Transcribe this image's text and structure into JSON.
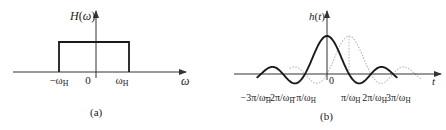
{
  "panel_a": {
    "ylabel": "H(ω)",
    "ylabel_fn": "H",
    "ylabel_arg": "ω",
    "xlabel": "ω",
    "ticks": [
      {
        "label": "−ω",
        "sub": "H",
        "x": 59
      },
      {
        "label": "0",
        "sub": "",
        "x": 88
      },
      {
        "label": "ω",
        "sub": "H",
        "x": 122
      }
    ],
    "caption": "(a)"
  },
  "panel_b": {
    "ylabel": "h(t)",
    "ylabel_fn": "h",
    "ylabel_arg": "t",
    "xlabel": "t",
    "origin_label": "0",
    "ticks": [
      {
        "label": "−3π/ω",
        "sub": "H",
        "n": -3
      },
      {
        "label": "−2π/ω",
        "sub": "H",
        "n": -2
      },
      {
        "label": "−π/ω",
        "sub": "H",
        "n": -1
      },
      {
        "label": "π/ω",
        "sub": "H",
        "n": 1
      },
      {
        "label": "2π/ω",
        "sub": "H",
        "n": 2
      },
      {
        "label": "3π/ω",
        "sub": "H",
        "n": 3
      }
    ],
    "caption": "(b)"
  },
  "colors": {
    "solid": "#1a1a1a",
    "dotted": "#b8b8b8",
    "axis": "#333333"
  },
  "chart_data": [
    {
      "type": "line",
      "title": "(a) Ideal low-pass frequency response",
      "xlabel": "ω",
      "ylabel": "H(ω)",
      "series": [
        {
          "name": "H(ω)",
          "x": [
            "-ωH",
            "-ωH",
            "ωH",
            "ωH"
          ],
          "values": [
            0,
            1,
            1,
            0
          ]
        }
      ],
      "x_ticks": [
        "-ωH",
        "0",
        "ωH"
      ],
      "grid": false
    },
    {
      "type": "line",
      "title": "(b) Impulse response",
      "xlabel": "t",
      "ylabel": "h(t)",
      "series": [
        {
          "name": "h(t) = sinc(ωH t/π) (solid)",
          "center": 0,
          "range_pi_over_wH": [
            -3.2,
            3.2
          ]
        },
        {
          "name": "shifted h(t − π/ωH) (dotted)",
          "center": 1,
          "range_pi_over_wH": [
            -1.7,
            4.3
          ]
        }
      ],
      "x_ticks": [
        "-3π/ωH",
        "-2π/ωH",
        "-π/ωH",
        "π/ωH",
        "2π/ωH",
        "3π/ωH"
      ],
      "grid": false
    }
  ]
}
